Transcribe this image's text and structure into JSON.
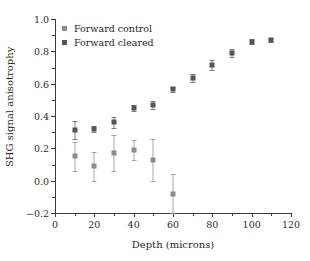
{
  "chart_data": {
    "type": "scatter",
    "title": "",
    "xlabel": "Depth (microns)",
    "ylabel": "SHG signal anisotrophy",
    "xlim": [
      0,
      120
    ],
    "ylim": [
      -0.2,
      1.0
    ],
    "xticks": [
      0,
      20,
      40,
      60,
      80,
      100,
      120
    ],
    "xticklabels": [
      "0",
      "20",
      "40",
      "60",
      "80",
      "100",
      "120"
    ],
    "xminorticks": [
      10,
      30,
      50,
      70,
      90,
      110
    ],
    "yticks": [
      -0.2,
      0.0,
      0.2,
      0.4,
      0.6,
      0.8,
      1.0
    ],
    "yticklabels": [
      "−0.2",
      "0.0",
      "0.2",
      "0.4",
      "0.6",
      "0.8",
      "1.0"
    ],
    "yminorticks": [
      -0.1,
      0.1,
      0.3,
      0.5,
      0.7,
      0.9
    ],
    "grid": false,
    "legend_position": "upper left",
    "marker": "square",
    "errorbars": true,
    "series": [
      {
        "name": "Forward control",
        "color": "#8c8c8c",
        "x": [
          10,
          20,
          30,
          40,
          50,
          60
        ],
        "values": [
          0.15,
          0.09,
          0.17,
          0.19,
          0.13,
          -0.08
        ],
        "yerr_low": [
          0.09,
          0.09,
          0.11,
          0.06,
          0.13,
          0.12
        ],
        "yerr_high": [
          0.09,
          0.09,
          0.11,
          0.06,
          0.13,
          0.12
        ]
      },
      {
        "name": "Forward cleared",
        "color": "#555555",
        "x": [
          10,
          20,
          30,
          40,
          50,
          60,
          70,
          80,
          90,
          100,
          110
        ],
        "values": [
          0.315,
          0.32,
          0.36,
          0.45,
          0.47,
          0.565,
          0.635,
          0.715,
          0.79,
          0.86,
          0.87
        ],
        "yerr_low": [
          0.055,
          0.02,
          0.035,
          0.02,
          0.025,
          0.015,
          0.025,
          0.03,
          0.025,
          0.015,
          0.01
        ],
        "yerr_high": [
          0.055,
          0.02,
          0.035,
          0.02,
          0.025,
          0.015,
          0.025,
          0.03,
          0.025,
          0.015,
          0.01
        ]
      }
    ]
  },
  "legend": {
    "items": [
      {
        "label": "Forward control",
        "color": "#8c8c8c"
      },
      {
        "label": "Forward cleared",
        "color": "#555555"
      }
    ]
  },
  "style": {
    "axis_color": "#3b3b3b",
    "text_color": "#1f1f1f",
    "background": "#ffffff"
  }
}
